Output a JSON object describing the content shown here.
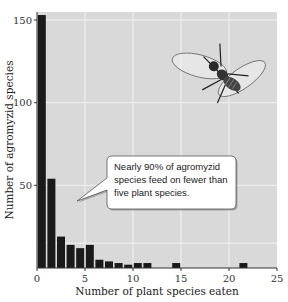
{
  "chart_data": {
    "type": "bar",
    "title": "",
    "xlabel": "Number of plant species eaten",
    "ylabel": "Number of agromyzid species",
    "xlim": [
      0,
      25
    ],
    "ylim": [
      0,
      155
    ],
    "xticks": [
      0,
      5,
      10,
      15,
      20,
      25
    ],
    "yticks": [
      50,
      100,
      150
    ],
    "grid": true,
    "x": [
      1,
      2,
      3,
      4,
      5,
      6,
      7,
      8,
      9,
      10,
      11,
      12,
      15,
      22
    ],
    "values": [
      153,
      54,
      19,
      14,
      12,
      14,
      5,
      4,
      3,
      2,
      3,
      3,
      3,
      3
    ],
    "annotation": "Nearly 90% of agromyzid species feed on fewer than five plant species.",
    "annotation_lines": [
      "Nearly 90% of agromyzid",
      "species feed on fewer than",
      "five plant species."
    ],
    "illustration": "agromyzid fly",
    "colors": {
      "plot_bg": "#d9d9d9",
      "bar": "#1a1a1a",
      "grid": "#f2f2f2",
      "callout_bg": "#ffffff"
    }
  }
}
